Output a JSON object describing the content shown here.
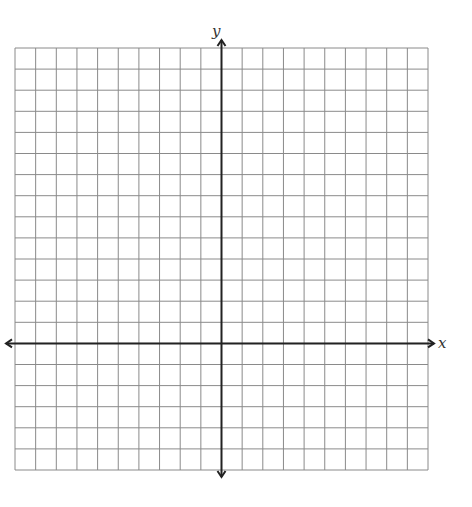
{
  "graph": {
    "x_label": "x",
    "y_label": "y",
    "columns": 20,
    "rows": 20,
    "origin_col": 10,
    "origin_row": 14,
    "grid_color": "#8a8a8a",
    "axis_color": "#222222"
  }
}
